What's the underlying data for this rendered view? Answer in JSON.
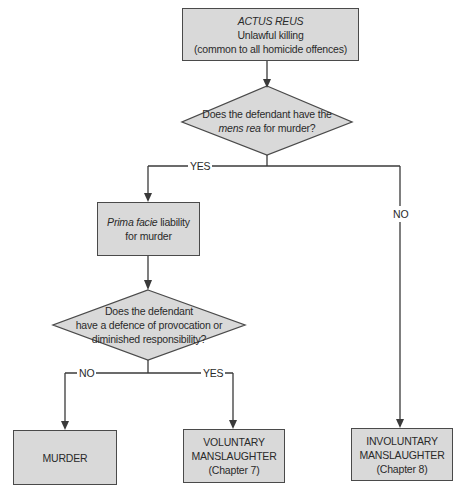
{
  "diagram": {
    "nodes": {
      "actus_reus": {
        "heading": "ACTUS REUS",
        "line1": "Unlawful killing",
        "line2": "(common to all homicide offences)"
      },
      "question_mens_rea": {
        "line1": "Does the defendant have the",
        "line2_italic": "mens rea",
        "line2_rest": " for murder?"
      },
      "prima_facie": {
        "italic": "Prima facie",
        "rest": " liability",
        "line2": "for murder"
      },
      "question_defence": {
        "line1": "Does the defendant",
        "line2": "have a defence of provocation or",
        "line3": "diminished responsibility?"
      },
      "murder": {
        "line1": "MURDER"
      },
      "voluntary": {
        "line1": "VOLUNTARY",
        "line2": "MANSLAUGHTER",
        "line3": "(Chapter 7)"
      },
      "involuntary": {
        "line1": "INVOLUNTARY",
        "line2": "MANSLAUGHTER",
        "line3": "(Chapter 8)"
      }
    },
    "edge_labels": {
      "mens_rea_yes": "YES",
      "mens_rea_no": "NO",
      "defence_no": "NO",
      "defence_yes": "YES"
    },
    "colors": {
      "box_fill": "#d9d9d9",
      "line": "#3a3a3a",
      "background": "#ffffff"
    }
  }
}
